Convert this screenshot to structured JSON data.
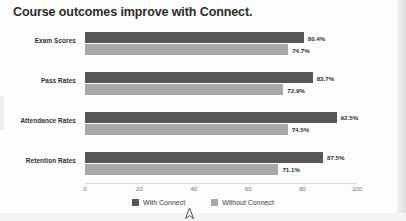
{
  "chart_data": {
    "type": "bar",
    "orientation": "horizontal",
    "title": "Course outcomes improve with Connect.",
    "categories": [
      "Exam Scores",
      "Pass Rates",
      "Attendance Rates",
      "Retention Rates"
    ],
    "series": [
      {
        "name": "With Connect",
        "color": "#575757",
        "values": [
          80.4,
          83.7,
          92.5,
          87.5
        ],
        "labels": [
          "80.4%",
          "83.7%",
          "92.5%",
          "87.5%"
        ]
      },
      {
        "name": "Without Connect",
        "color": "#a8a8a8",
        "values": [
          74.7,
          72.9,
          74.5,
          71.1
        ],
        "labels": [
          "74.7%",
          "72.9%",
          "74.5%",
          "71.1%"
        ]
      }
    ],
    "xlabel": "",
    "ylabel": "",
    "xlim": [
      0,
      100
    ],
    "xticks": [
      0,
      20,
      40,
      60,
      80,
      100
    ],
    "xtick_labels": [
      "0",
      "20",
      "40",
      "60",
      "80",
      "100"
    ],
    "grid": false,
    "legend_position": "bottom"
  },
  "legend": {
    "items": [
      {
        "label": "With Connect",
        "color": "#575757"
      },
      {
        "label": "Without Connect",
        "color": "#a8a8a8"
      }
    ]
  },
  "cursor": {
    "icon": "mouse-pointer-icon"
  }
}
